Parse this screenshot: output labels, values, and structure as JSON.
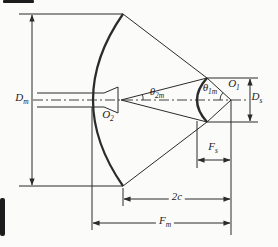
{
  "diagram": {
    "type": "cassegrain-antenna-geometry",
    "background_color": "#fbfbfa",
    "line_color": "#2b2b2b",
    "labels": {
      "main_diameter": {
        "base": "D",
        "sub": "m"
      },
      "feed_point": {
        "base": "O",
        "sub": "2"
      },
      "feed_half_angle": {
        "base": "θ",
        "sub": "2m"
      },
      "sub_half_angle": {
        "base": "θ",
        "sub": "1m"
      },
      "virtual_focus": {
        "base": "O",
        "sub": "1"
      },
      "sub_diameter": {
        "base": "D",
        "sub": "s"
      },
      "sub_focal": {
        "base": "F",
        "sub": "s"
      },
      "foci_distance": {
        "base": "2c",
        "sub": ""
      },
      "main_focal": {
        "base": "F",
        "sub": "m"
      }
    }
  }
}
